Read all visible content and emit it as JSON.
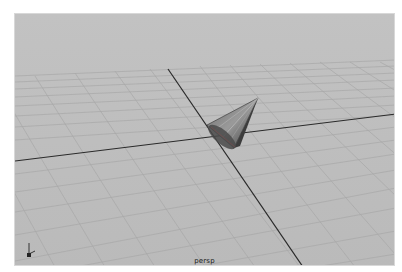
{
  "app": {
    "name": "3D viewport"
  },
  "viewport": {
    "camera_label": "persp",
    "background_color": "#bdbdbd",
    "grid_color": "#a9a9a9",
    "axis_line_color": "#2a2a2a",
    "objects": [
      {
        "type": "cone",
        "name": "cone-object"
      }
    ],
    "axis_gizmo": {
      "labels": [
        "y",
        "z",
        "x"
      ]
    }
  }
}
